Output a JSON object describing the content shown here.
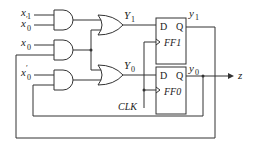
{
  "diagram": {
    "inputs": {
      "x1": "x",
      "x1_sub": "1",
      "x0p_a": "x",
      "x0p_a_sub": "0",
      "x0p_a_prime": "′",
      "x0": "x",
      "x0_sub": "0",
      "x0p_b": "x",
      "x0p_b_sub": "0",
      "x0p_b_prime": "′"
    },
    "signals": {
      "Y1": "Y",
      "Y1_sub": "1",
      "Y0": "Y",
      "Y0_sub": "0",
      "y1": "y",
      "y1_sub": "1",
      "y0": "y",
      "y0_sub": "0"
    },
    "flipflops": [
      {
        "d": "D",
        "q": "Q",
        "name": "FF1"
      },
      {
        "d": "D",
        "q": "Q",
        "name": "FF0"
      }
    ],
    "clock": "CLK",
    "output": "z"
  }
}
